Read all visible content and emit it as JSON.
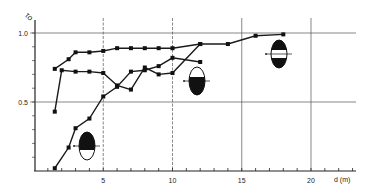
{
  "chart_data": {
    "type": "line",
    "title": "",
    "xlabel": "d (m)",
    "ylabel": "τ0",
    "xlim": [
      0,
      23
    ],
    "ylim": [
      0,
      1.05
    ],
    "x_ticks": [
      5,
      10,
      15,
      20
    ],
    "y_ticks": [
      0.5,
      1.0
    ],
    "x_tick_labels": [
      "5",
      "10",
      "15",
      "20"
    ],
    "y_tick_labels": [
      "0.5",
      "1.0"
    ],
    "grid": true,
    "legend": "none (series identified by ellipse glyph icons)",
    "series": [
      {
        "name": "white-center-band glyph",
        "x": [
          1.5,
          2.5,
          3,
          4,
          5,
          6,
          7,
          8,
          9,
          10,
          12,
          14,
          16,
          18
        ],
        "y": [
          0.74,
          0.81,
          0.86,
          0.86,
          0.87,
          0.89,
          0.89,
          0.89,
          0.89,
          0.89,
          0.92,
          0.92,
          0.98,
          0.99
        ]
      },
      {
        "name": "filled-lower glyph",
        "x": [
          1.5,
          2,
          3,
          4,
          5,
          6,
          7,
          8,
          9,
          10,
          12
        ],
        "y": [
          0.43,
          0.73,
          0.72,
          0.72,
          0.71,
          0.62,
          0.59,
          0.75,
          0.7,
          0.71,
          0.92
        ]
      },
      {
        "name": "filled-upper glyph",
        "x": [
          1.5,
          2.5,
          3,
          4,
          5,
          6,
          7,
          8,
          9,
          10,
          12
        ],
        "y": [
          0.02,
          0.17,
          0.31,
          0.38,
          0.54,
          0.61,
          0.72,
          0.73,
          0.76,
          0.82,
          0.79
        ]
      }
    ]
  },
  "axes": {
    "y_label": "τo",
    "x_label": "d (m)"
  },
  "glyphs": [
    {
      "name": "white-band-ellipse",
      "x": 18,
      "y": 0.85
    },
    {
      "name": "bottom-filled-ellipse",
      "x": 12,
      "y": 0.62
    },
    {
      "name": "top-filled-ellipse",
      "x": 4,
      "y": 0.16
    }
  ]
}
